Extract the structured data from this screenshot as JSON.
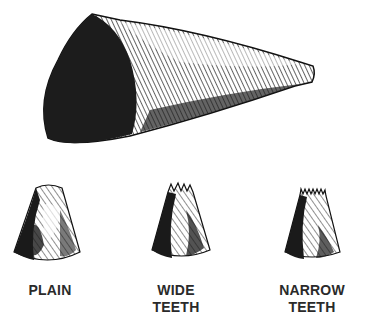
{
  "illustration": {
    "main_item": "pastry-bag-cone",
    "tips": [
      {
        "id": "plain",
        "label_lines": [
          "PLAIN"
        ]
      },
      {
        "id": "wide-teeth",
        "label_lines": [
          "WIDE",
          "TEETH"
        ]
      },
      {
        "id": "narrow-teeth",
        "label_lines": [
          "NARROW",
          "TEETH"
        ]
      }
    ]
  },
  "colors": {
    "ink": "#1a1a1a",
    "paper": "#ffffff"
  }
}
